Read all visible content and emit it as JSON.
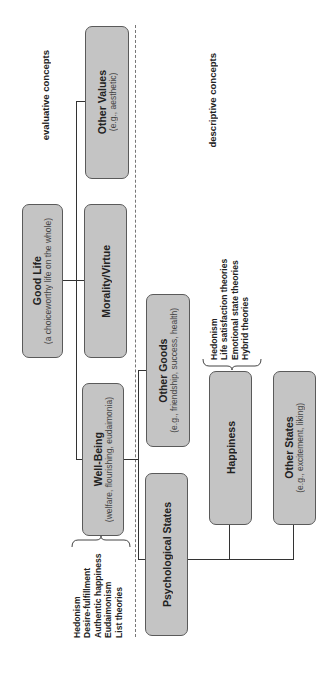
{
  "regions": {
    "evaluative_label": "evaluative concepts",
    "descriptive_label": "descriptive concepts"
  },
  "nodes": {
    "good_life": {
      "title": "Good Life",
      "subtitle": "(a choiceworthy life on the whole)"
    },
    "other_values": {
      "title": "Other Values",
      "subtitle": "(e.g., aesthetic)"
    },
    "morality_virtue": {
      "title": "Morality/Virtue"
    },
    "well_being": {
      "title": "Well-Being",
      "subtitle": "(welfare, flourishing, eudaimonia)"
    },
    "other_goods": {
      "title": "Other Goods",
      "subtitle": "(e.g., friendship, success, health)"
    },
    "psychological_states": {
      "title": "Psychological States"
    },
    "happiness": {
      "title": "Happiness"
    },
    "other_states": {
      "title": "Other States",
      "subtitle": "(e.g., excitement, liking)"
    }
  },
  "well_being_theories": [
    "Hedonism",
    "Desire-fulfillment",
    "Authentic happiness",
    "Eudaimonism",
    "List theories"
  ],
  "happiness_theories": [
    "Hedonism",
    "Life satisfaction theories",
    "Emotional state theories",
    "Hybrid theories"
  ],
  "colors": {
    "box_fill": "#c4c4c4",
    "box_border": "#5a5a5a",
    "connector": "#333333",
    "divider": "#777777"
  }
}
